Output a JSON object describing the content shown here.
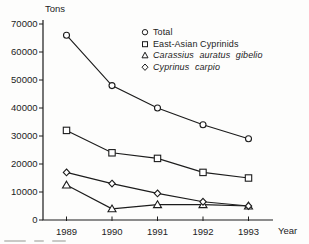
{
  "figure": {
    "ylabel": "Tons",
    "xlabel": "Year",
    "ink_color": "#1c1c1c",
    "background_color": "#fdfdfc",
    "marker_fill": "#ffffff"
  },
  "chart_data": {
    "type": "line",
    "title": "",
    "xlabel": "Year",
    "ylabel": "Tons",
    "ylim": [
      0,
      70000
    ],
    "y_ticks": [
      0,
      10000,
      20000,
      30000,
      40000,
      50000,
      60000,
      70000
    ],
    "categories": [
      "1989",
      "1990",
      "1991",
      "1992",
      "1993"
    ],
    "grid": false,
    "legend_position": "top-right-inside",
    "series": [
      {
        "name": "Total",
        "marker": "circle",
        "values": [
          66000,
          48000,
          40000,
          34000,
          29000
        ]
      },
      {
        "name": "East-Asian Cyprinids",
        "marker": "square",
        "values": [
          32000,
          24000,
          22000,
          17000,
          15000
        ]
      },
      {
        "name": "Carassius auratus gibelio",
        "marker": "triangle",
        "values": [
          12500,
          4000,
          5500,
          5500,
          5000
        ]
      },
      {
        "name": "Cyprinus carpio",
        "marker": "diamond",
        "values": [
          17000,
          13000,
          9500,
          6500,
          5000
        ]
      }
    ]
  }
}
